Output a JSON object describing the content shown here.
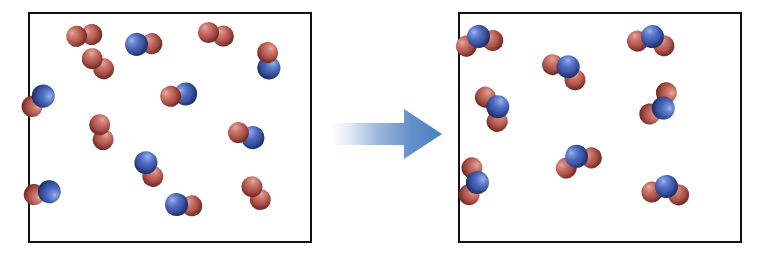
{
  "diagram": {
    "background_color": "#ffffff"
  },
  "colors": {
    "oxygen_atom": "#b5524e",
    "nitrogen_atom": "#3a56a8",
    "box_border": "#111111",
    "box_fill": "#ffffff",
    "arrow_start": "#ffffff",
    "arrow_end": "#4a7fc1"
  },
  "arrow": {
    "name": "reaction-arrow",
    "direction": "right",
    "gradient_start": "#ffffff",
    "gradient_end": "#4a7fc1"
  },
  "boxes": [
    {
      "id": "reactants",
      "label": "Reactants",
      "molecule_counts": {
        "NO": 8,
        "O2": 5,
        "total": 13
      },
      "molecules": [
        {
          "species": "O2",
          "x": 46,
          "y": 22,
          "rot": -18,
          "atoms": [
            "o",
            "o"
          ]
        },
        {
          "species": "NO",
          "x": 106,
          "y": 30,
          "rot": -14,
          "atoms": [
            "n",
            "o"
          ]
        },
        {
          "species": "O2",
          "x": 178,
          "y": 18,
          "rot": 2,
          "atoms": [
            "o",
            "o"
          ]
        },
        {
          "species": "NO",
          "x": 238,
          "y": 38,
          "rot": 74,
          "atoms": [
            "o",
            "n"
          ]
        },
        {
          "species": "NO",
          "x": 14,
          "y": 82,
          "rot": 126,
          "atoms": [
            "n",
            "o"
          ]
        },
        {
          "species": "NO",
          "x": 140,
          "y": 82,
          "rot": -20,
          "atoms": [
            "o",
            "n"
          ]
        },
        {
          "species": "O2",
          "x": 70,
          "y": 110,
          "rot": 66,
          "atoms": [
            "o",
            "o"
          ]
        },
        {
          "species": "NO",
          "x": 208,
          "y": 118,
          "rot": 8,
          "atoms": [
            "o",
            "n"
          ]
        },
        {
          "species": "NO",
          "x": 116,
          "y": 148,
          "rot": 52,
          "atoms": [
            "n",
            "o"
          ]
        },
        {
          "species": "NO",
          "x": 20,
          "y": 178,
          "rot": 158,
          "atoms": [
            "n",
            "o"
          ]
        },
        {
          "species": "O2",
          "x": 222,
          "y": 172,
          "rot": 46,
          "atoms": [
            "o",
            "o"
          ]
        },
        {
          "species": "NO",
          "x": 146,
          "y": 190,
          "rot": -6,
          "atoms": [
            "n",
            "o"
          ]
        },
        {
          "species": "O2",
          "x": 62,
          "y": 44,
          "rot": 30,
          "atoms": [
            "o",
            "o"
          ]
        }
      ]
    },
    {
      "id": "products",
      "label": "Products",
      "molecule_counts": {
        "NO2": 8,
        "total": 8
      },
      "molecules": [
        {
          "species": "NO2",
          "x": 18,
          "y": 22,
          "rot": -12
        },
        {
          "species": "NO2",
          "x": 192,
          "y": 22,
          "rot": 10
        },
        {
          "species": "NO2",
          "x": 108,
          "y": 52,
          "rot": 34
        },
        {
          "species": "NO2",
          "x": 38,
          "y": 92,
          "rot": 64
        },
        {
          "species": "NO2",
          "x": 204,
          "y": 94,
          "rot": 128
        },
        {
          "species": "NO2",
          "x": 116,
          "y": 142,
          "rot": -22
        },
        {
          "species": "NO2",
          "x": 18,
          "y": 168,
          "rot": 96
        },
        {
          "species": "NO2",
          "x": 206,
          "y": 172,
          "rot": 6
        }
      ]
    }
  ]
}
